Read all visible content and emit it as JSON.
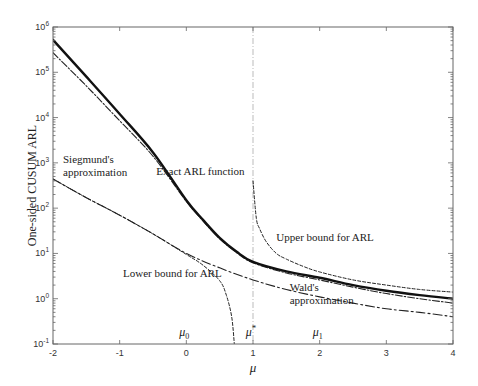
{
  "chart_data": {
    "type": "line",
    "title": "",
    "xlabel": "μ",
    "ylabel": "One-sided CUSUM ARL",
    "xscale": "linear",
    "yscale": "log",
    "xlim": [
      -2,
      4
    ],
    "ylim": [
      0.1,
      1000000
    ],
    "x_ticks": [
      -2,
      -1,
      0,
      1,
      2,
      3,
      4
    ],
    "x_tick_labels": [
      "-2",
      "-1",
      "0",
      "1",
      "2",
      "3",
      "4"
    ],
    "y_ticks": [
      0.1,
      1,
      10,
      100,
      1000,
      10000,
      100000,
      1000000
    ],
    "y_tick_labels": [
      {
        "base": "10",
        "exp": "-1"
      },
      {
        "base": "10",
        "exp": "0"
      },
      {
        "base": "10",
        "exp": "1"
      },
      {
        "base": "10",
        "exp": "2"
      },
      {
        "base": "10",
        "exp": "3"
      },
      {
        "base": "10",
        "exp": "4"
      },
      {
        "base": "10",
        "exp": "5"
      },
      {
        "base": "10",
        "exp": "6"
      }
    ],
    "grid": false,
    "legend": null,
    "series": [
      {
        "name": "Exact ARL function",
        "style": "solid-thick",
        "x": [
          -2,
          -1.5,
          -1,
          -0.5,
          0,
          0.25,
          0.5,
          0.75,
          1,
          1.5,
          2,
          2.5,
          3,
          3.5,
          4
        ],
        "values": [
          520000,
          80000,
          12000,
          1700,
          150,
          55,
          22,
          11,
          6.5,
          4.0,
          2.9,
          2.0,
          1.5,
          1.2,
          1.0
        ]
      },
      {
        "name": "Siegmund's approximation",
        "style": "dash-dot",
        "x": [
          -2,
          -1.5,
          -1,
          -0.5,
          0,
          0.25,
          0.5,
          0.75,
          1,
          1.5,
          2,
          2.5,
          3,
          3.5,
          4
        ],
        "values": [
          270000,
          50000,
          8500,
          1400,
          140,
          52,
          21,
          10.5,
          6.2,
          3.7,
          2.6,
          1.8,
          1.3,
          1.0,
          0.8
        ]
      },
      {
        "name": "Lower bound for ARL",
        "style": "dashed",
        "x": [
          -2,
          -1.5,
          -1,
          -0.5,
          0,
          0.25,
          0.5,
          0.6,
          0.68,
          0.72
        ],
        "values": [
          440,
          170,
          70,
          27,
          9.5,
          5.5,
          2.5,
          1.2,
          0.4,
          0.1
        ]
      },
      {
        "name": "Wald's approximation",
        "style": "long-dash-dot",
        "x": [
          -2,
          -1.5,
          -1,
          -0.5,
          0,
          0.5,
          1,
          1.5,
          2,
          2.5,
          3,
          3.5,
          4
        ],
        "values": [
          440,
          170,
          70,
          27,
          10,
          4.8,
          2.6,
          1.6,
          1.1,
          0.8,
          0.6,
          0.5,
          0.4
        ]
      },
      {
        "name": "Upper bound for ARL",
        "style": "dashed",
        "x": [
          1.0,
          1.05,
          1.1,
          1.2,
          1.35,
          1.5,
          1.75,
          2,
          2.5,
          3,
          3.5,
          4
        ],
        "values": [
          400,
          60,
          35,
          18,
          10,
          7.5,
          5.2,
          3.9,
          2.6,
          2.0,
          1.6,
          1.4
        ]
      }
    ],
    "reference_lines": [
      {
        "type": "vertical",
        "x": 1,
        "style": "dash-dot-light",
        "label": "μ*"
      }
    ],
    "annotations": [
      {
        "text": "Siegmund's",
        "x": -1.85,
        "y": 1000
      },
      {
        "text": "approximation",
        "x": -1.85,
        "y": 500
      },
      {
        "text": "Exact ARL function",
        "x": -0.45,
        "y": 540
      },
      {
        "text": "Upper bound for ARL",
        "x": 1.35,
        "y": 19
      },
      {
        "text": "Lower bound for ARL",
        "x": -0.95,
        "y": 3.0
      },
      {
        "text": "Wald's",
        "x": 1.55,
        "y": 1.45
      },
      {
        "text": "approximation",
        "x": 1.55,
        "y": 0.75
      }
    ],
    "x_markers": [
      {
        "label": "μ0",
        "base": "μ",
        "sub": "0",
        "x": 0
      },
      {
        "label": "μ*",
        "base": "μ",
        "sup": "*",
        "x": 1
      },
      {
        "label": "μ1",
        "base": "μ",
        "sub": "1",
        "x": 2
      }
    ]
  }
}
